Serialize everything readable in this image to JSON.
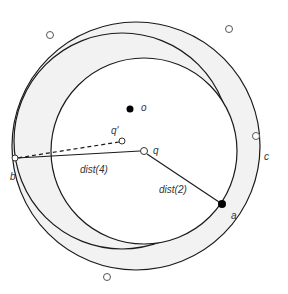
{
  "diagram": {
    "colors": {
      "background": "#ffffff",
      "ring_fill": "#f2f2f2",
      "stroke": "#1a1a1a",
      "point_fill": "#000000"
    },
    "circles": {
      "outer_c": {
        "cx": 136,
        "cy": 146,
        "r": 124,
        "label": "c"
      },
      "middle": {
        "cx": 122,
        "cy": 141,
        "r": 108
      },
      "inner": {
        "cx": 144,
        "cy": 151,
        "r": 93
      }
    },
    "points": {
      "o": {
        "x": 130,
        "y": 105,
        "label": "o",
        "filled": true
      },
      "q_prime": {
        "x": 122,
        "y": 141,
        "label": "q'",
        "filled": false
      },
      "q": {
        "x": 144,
        "y": 151,
        "label": "q",
        "filled": false
      },
      "a": {
        "x": 222,
        "y": 204,
        "label": "a",
        "filled": true
      },
      "b": {
        "x": 14,
        "y": 158,
        "label": "b",
        "filled": false
      }
    },
    "segments": {
      "dist4": {
        "label": "dist(4)"
      },
      "dist2": {
        "label": "dist(2)"
      }
    },
    "scattered_points": [
      {
        "x": 50,
        "y": 35
      },
      {
        "x": 229,
        "y": 29
      },
      {
        "x": 256,
        "y": 136
      },
      {
        "x": 107,
        "y": 277
      }
    ]
  }
}
